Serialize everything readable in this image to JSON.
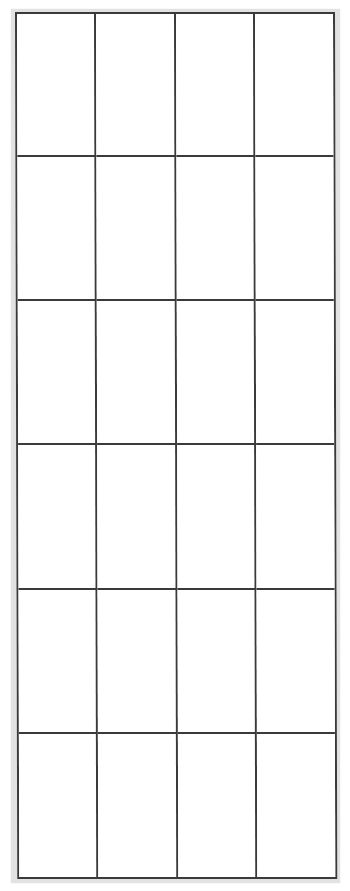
{
  "document": {
    "type": "blank-grid",
    "columns": 4,
    "rows": 6,
    "cells": [
      [
        "",
        "",
        "",
        ""
      ],
      [
        "",
        "",
        "",
        ""
      ],
      [
        "",
        "",
        "",
        ""
      ],
      [
        "",
        "",
        "",
        ""
      ],
      [
        "",
        "",
        "",
        ""
      ],
      [
        "",
        "",
        "",
        ""
      ]
    ]
  },
  "colors": {
    "grid_line": "#3a3a3a",
    "frame": "#e2e2e2",
    "background": "#ffffff"
  }
}
